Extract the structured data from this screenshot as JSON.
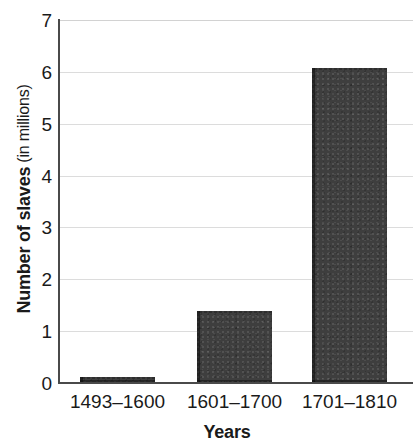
{
  "chart_data": {
    "type": "bar",
    "title": "",
    "categories": [
      "1493–1600",
      "1601–1700",
      "1701–1810"
    ],
    "values": [
      0.12,
      1.39,
      6.07
    ],
    "series": [
      {
        "name": "Number of slaves (in millions)",
        "values": [
          0.12,
          1.39,
          6.07
        ]
      }
    ],
    "xlabel": "Years",
    "ylabel": "Number of slaves (in millions)",
    "ylabel_strong": "Number of slaves",
    "ylabel_light": "(in millions)",
    "ylim": [
      0,
      7
    ],
    "ytick_labels": [
      "7",
      "6",
      "5",
      "4",
      "3",
      "2",
      "1",
      "0"
    ],
    "ytick_values": [
      7,
      6,
      5,
      4,
      3,
      2,
      1,
      0
    ],
    "grid": true,
    "grid_axis": "y",
    "legend": false,
    "bar_color": "#3e3e3e",
    "grid_color": "#dcdcdc",
    "axis_color": "#4a4a4a",
    "background_color": "#ffffff"
  }
}
